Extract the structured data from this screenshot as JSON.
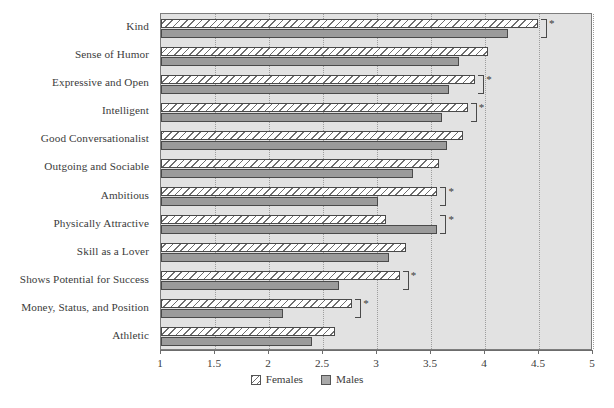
{
  "chart_data": {
    "type": "bar",
    "orientation": "horizontal",
    "title": "",
    "subtitle": "",
    "xlabel": "",
    "ylabel": "",
    "xlim": [
      1,
      5
    ],
    "xticks": [
      "1",
      "1.5",
      "2",
      "2.5",
      "3",
      "3.5",
      "4",
      "4.5",
      "5"
    ],
    "xtick_values": [
      1,
      1.5,
      2,
      2.5,
      3,
      3.5,
      4,
      4.5,
      5
    ],
    "grid": true,
    "grid_axis": "x",
    "grid_style": "dotted",
    "legend_position": "bottom-center",
    "categories": [
      "Kind",
      "Sense of Humor",
      "Expressive and Open",
      "Intelligent",
      "Good Conversationalist",
      "Outgoing and Sociable",
      "Ambitious",
      "Physically Attractive",
      "Skill as a Lover",
      "Shows Potential for Success",
      "Money, Status, and Position",
      "Athletic"
    ],
    "series": [
      {
        "name": "Females",
        "pattern": "diagonal-hatch",
        "color": "#ffffff",
        "values": [
          4.49,
          4.03,
          3.91,
          3.84,
          3.8,
          3.57,
          3.56,
          3.08,
          3.27,
          3.21,
          2.77,
          2.61
        ]
      },
      {
        "name": "Males",
        "pattern": "solid",
        "color": "#9b9b9b",
        "values": [
          4.21,
          3.76,
          3.67,
          3.6,
          3.65,
          3.33,
          3.01,
          3.56,
          3.11,
          2.65,
          2.13,
          2.4
        ]
      }
    ],
    "annotations": {
      "symbol": "*",
      "meaning": "significant gender difference",
      "bracketed_categories": [
        "Kind",
        "Expressive and Open",
        "Intelligent",
        "Ambitious",
        "Physically Attractive",
        "Shows Potential for Success",
        "Money, Status, and Position"
      ]
    }
  },
  "legend": {
    "items": [
      {
        "label": "Females",
        "swatch": "hatched-swatch"
      },
      {
        "label": "Males",
        "swatch": "gray-swatch"
      }
    ]
  },
  "colors": {
    "plot_background": "#e2e2e2",
    "page_background": "#ffffff",
    "female_bar": "#ffffff",
    "male_bar": "#9b9b9b",
    "bar_outline": "#4a4a4a",
    "axis": "#6c6c6c",
    "gridline": "#9d9d9d",
    "text": "#3b3b3b"
  }
}
